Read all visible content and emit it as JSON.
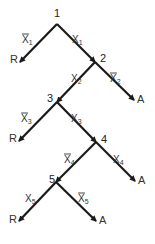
{
  "diagram": {
    "type": "decision-tree",
    "nodes": [
      {
        "id": "1",
        "label": "1"
      },
      {
        "id": "2",
        "label": "2"
      },
      {
        "id": "3",
        "label": "3"
      },
      {
        "id": "4",
        "label": "4"
      },
      {
        "id": "5",
        "label": "5"
      }
    ],
    "terminals": [
      {
        "id": "t1",
        "label": "R"
      },
      {
        "id": "t2",
        "label": "A"
      },
      {
        "id": "t3",
        "label": "R"
      },
      {
        "id": "t4",
        "label": "A"
      },
      {
        "id": "t5",
        "label": "R"
      },
      {
        "id": "t6",
        "label": "A"
      }
    ],
    "edges": [
      {
        "from": "1",
        "to": "t1",
        "var": "X",
        "index": "1",
        "negated": true
      },
      {
        "from": "1",
        "to": "2",
        "var": "X",
        "index": "1",
        "negated": false
      },
      {
        "from": "2",
        "to": "3",
        "var": "X",
        "index": "2",
        "negated": false
      },
      {
        "from": "2",
        "to": "t2",
        "var": "X",
        "index": "2",
        "negated": true
      },
      {
        "from": "3",
        "to": "t3",
        "var": "X",
        "index": "3",
        "negated": true
      },
      {
        "from": "3",
        "to": "4",
        "var": "X",
        "index": "3",
        "negated": false
      },
      {
        "from": "4",
        "to": "5",
        "var": "X",
        "index": "4",
        "negated": true
      },
      {
        "from": "4",
        "to": "t4",
        "var": "X",
        "index": "4",
        "negated": false
      },
      {
        "from": "5",
        "to": "t5",
        "var": "X",
        "index": "5",
        "negated": false
      },
      {
        "from": "5",
        "to": "t6",
        "var": "X",
        "index": "5",
        "negated": true
      }
    ]
  }
}
